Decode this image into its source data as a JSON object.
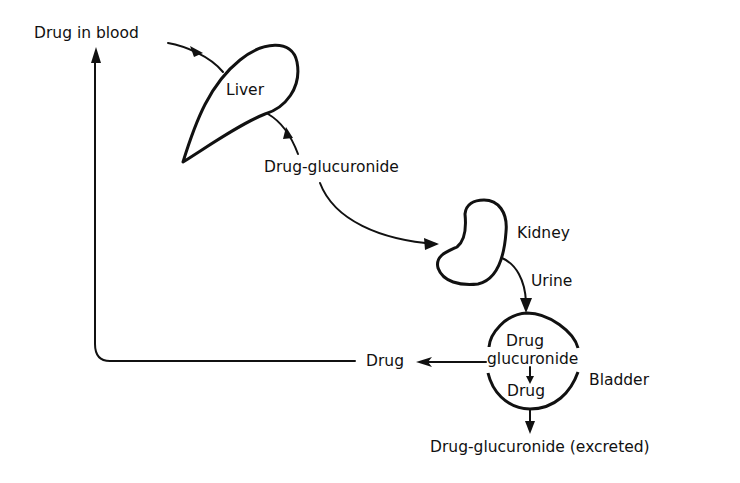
{
  "diagram": {
    "type": "flow",
    "title": "",
    "labels": {
      "drug_in_blood": "Drug in blood",
      "liver": "Liver",
      "drug_glucuronide": "Drug-glucuronide",
      "kidney": "Kidney",
      "urine": "Urine",
      "bladder_drug_top": "Drug",
      "bladder_glucuronide": "glucuronide",
      "bladder_drug_bottom": "Drug",
      "bladder": "Bladder",
      "drug_reabsorbed": "Drug",
      "excreted": "Drug-glucuronide (excreted)"
    },
    "nodes": [
      {
        "id": "blood",
        "label": "Drug in blood"
      },
      {
        "id": "liver",
        "label": "Liver",
        "shape": "teardrop"
      },
      {
        "id": "dg",
        "label": "Drug-glucuronide"
      },
      {
        "id": "kidney",
        "label": "Kidney",
        "shape": "bean"
      },
      {
        "id": "bladder",
        "label": "Bladder",
        "shape": "circle",
        "contents": [
          "Drug glucuronide",
          "Drug"
        ]
      },
      {
        "id": "drug_out",
        "label": "Drug"
      },
      {
        "id": "excreted",
        "label": "Drug-glucuronide (excreted)"
      }
    ],
    "edges": [
      {
        "from": "blood",
        "to": "liver"
      },
      {
        "from": "liver",
        "to": "dg"
      },
      {
        "from": "dg",
        "to": "kidney"
      },
      {
        "from": "kidney",
        "to": "bladder",
        "label": "Urine"
      },
      {
        "from": "bladder_glucuronide",
        "to": "bladder_drug",
        "note": "hydrolysis inside bladder"
      },
      {
        "from": "bladder",
        "to": "drug_out"
      },
      {
        "from": "drug_out",
        "to": "blood",
        "note": "return loop"
      },
      {
        "from": "bladder",
        "to": "excreted"
      }
    ],
    "colors": {
      "ink": "#111111",
      "background": "#ffffff"
    }
  }
}
